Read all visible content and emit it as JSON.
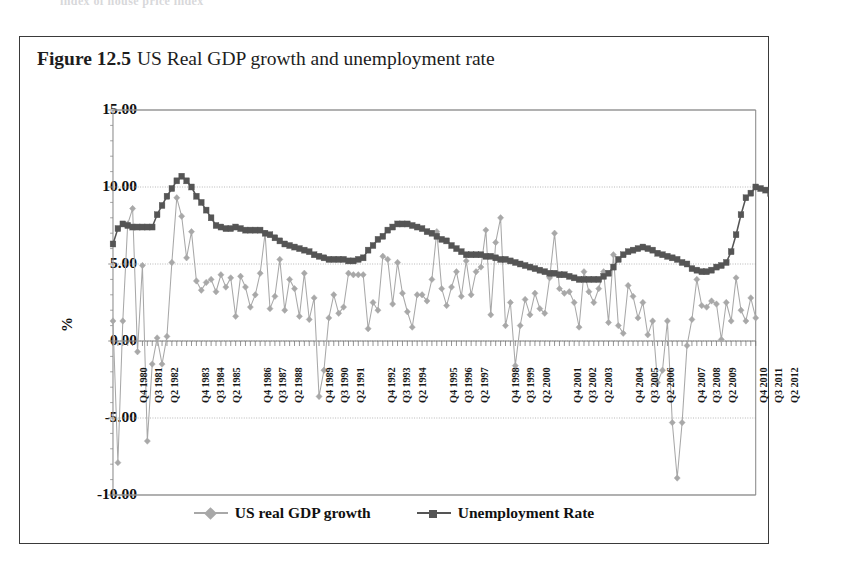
{
  "running_head": "index of house price index",
  "figure": {
    "number": "Figure 12.5",
    "caption": "US Real GDP growth and unemployment rate"
  },
  "colors": {
    "gdp_series": "#a8a8a8",
    "unemployment_series": "#555555",
    "axis": "#8a8a8a",
    "gridline": "#aaaaaa",
    "frame": "#3a3a3a",
    "text": "#111111"
  },
  "chart_data": {
    "type": "line",
    "title": "US Real GDP growth and unemployment rate",
    "xlabel": "",
    "ylabel": "%",
    "ylim": [
      -10,
      15
    ],
    "yticks": [
      15.0,
      10.0,
      5.0,
      0.0,
      -5.0,
      -10.0
    ],
    "ytick_labels": [
      "15.00",
      "10.00",
      "5.00",
      "0.00",
      "-5.00",
      "-10.00"
    ],
    "grid": true,
    "legend_position": "bottom",
    "xtick_labels": [
      "Q4 1980",
      "Q3 1981",
      "Q2 1982",
      "Q4 1983",
      "Q3 1984",
      "Q2 1985",
      "Q4 1986",
      "Q3 1987",
      "Q2 1988",
      "Q4 1989",
      "Q3 1990",
      "Q2 1991",
      "Q4 1992",
      "Q3 1993",
      "Q2 1994",
      "Q4 1995",
      "Q3 1996",
      "Q2 1997",
      "Q4 1998",
      "Q3 1999",
      "Q2 2000",
      "Q4 2001",
      "Q3 2002",
      "Q2 2003",
      "Q4 2004",
      "Q3 2005",
      "Q2 2006",
      "Q4 2007",
      "Q3 2008",
      "Q2 2009",
      "Q4 2010",
      "Q3 2011",
      "Q2 2012"
    ],
    "xtick_indices": [
      3,
      6,
      9,
      15,
      18,
      21,
      27,
      30,
      33,
      39,
      42,
      45,
      51,
      54,
      57,
      63,
      66,
      69,
      75,
      78,
      81,
      87,
      90,
      93,
      99,
      102,
      105,
      111,
      114,
      117,
      123,
      126,
      129
    ],
    "x_start_label": "Q1 1980",
    "x_end_label": "Q4 2012",
    "series": [
      {
        "name": "US real GDP growth",
        "marker": "diamond",
        "color": "#a8a8a8",
        "values": [
          1.3,
          -7.9,
          1.3,
          7.6,
          8.6,
          -0.7,
          4.9,
          -6.5,
          -1.5,
          0.2,
          -1.5,
          0.3,
          5.1,
          9.3,
          8.1,
          5.4,
          7.1,
          3.9,
          3.3,
          3.8,
          4.0,
          3.2,
          4.3,
          3.5,
          4.1,
          1.6,
          4.2,
          3.5,
          2.2,
          3.0,
          4.4,
          7.0,
          2.1,
          2.9,
          5.3,
          2.0,
          4.0,
          3.4,
          1.6,
          4.4,
          1.4,
          2.8,
          -3.6,
          -1.9,
          1.5,
          3.0,
          1.8,
          2.2,
          4.4,
          4.3,
          4.3,
          4.3,
          0.8,
          2.5,
          2.0,
          5.5,
          5.3,
          2.4,
          5.1,
          3.1,
          1.9,
          0.9,
          3.0,
          3.0,
          2.6,
          4.0,
          7.1,
          3.4,
          2.3,
          3.5,
          4.5,
          2.9,
          5.2,
          3.0,
          4.5,
          4.8,
          7.2,
          1.7,
          6.4,
          8.0,
          1.0,
          2.5,
          -1.6,
          1.0,
          2.7,
          1.7,
          3.1,
          2.1,
          1.8,
          4.1,
          7.0,
          3.4,
          3.1,
          3.2,
          2.5,
          0.9,
          4.5,
          3.2,
          2.5,
          3.4,
          4.5,
          1.2,
          5.6,
          1.0,
          0.5,
          3.6,
          2.9,
          1.5,
          2.5,
          0.4,
          1.3,
          -2.7,
          -1.9,
          1.3,
          -5.3,
          -8.9,
          -5.3,
          -0.3,
          1.4,
          4.0,
          2.3,
          2.2,
          2.6,
          2.4,
          0.1,
          2.5,
          1.3,
          4.1,
          2.0,
          1.3,
          2.8,
          1.5
        ]
      },
      {
        "name": "Unemployment Rate",
        "marker": "square",
        "color": "#555555",
        "values": [
          6.3,
          7.3,
          7.6,
          7.5,
          7.4,
          7.4,
          7.4,
          7.4,
          7.4,
          8.2,
          8.8,
          9.4,
          9.9,
          10.4,
          10.7,
          10.4,
          10.0,
          9.4,
          9.0,
          8.5,
          8.0,
          7.5,
          7.4,
          7.3,
          7.3,
          7.4,
          7.3,
          7.2,
          7.2,
          7.2,
          7.2,
          7.0,
          6.9,
          6.7,
          6.5,
          6.3,
          6.2,
          6.1,
          6.0,
          5.9,
          5.8,
          5.6,
          5.5,
          5.4,
          5.3,
          5.3,
          5.3,
          5.3,
          5.2,
          5.2,
          5.3,
          5.4,
          5.9,
          6.2,
          6.6,
          6.8,
          7.2,
          7.4,
          7.6,
          7.6,
          7.6,
          7.5,
          7.4,
          7.3,
          7.1,
          7.0,
          6.8,
          6.6,
          6.5,
          6.2,
          6.0,
          5.8,
          5.6,
          5.6,
          5.6,
          5.6,
          5.5,
          5.5,
          5.4,
          5.3,
          5.3,
          5.2,
          5.1,
          5.0,
          4.9,
          4.8,
          4.7,
          4.6,
          4.5,
          4.4,
          4.4,
          4.3,
          4.3,
          4.2,
          4.1,
          4.0,
          4.0,
          4.0,
          4.0,
          4.0,
          4.2,
          4.4,
          4.8,
          5.3,
          5.6,
          5.8,
          5.9,
          6.0,
          6.1,
          6.0,
          5.9,
          5.7,
          5.6,
          5.5,
          5.4,
          5.3,
          5.1,
          5.0,
          4.7,
          4.6,
          4.5,
          4.5,
          4.6,
          4.8,
          4.9,
          5.1,
          5.8,
          6.9,
          8.2,
          9.3,
          9.6,
          10.0,
          9.9,
          9.8,
          9.6,
          9.6,
          9.6,
          9.5,
          9.1,
          9.0,
          9.0,
          8.9,
          8.3,
          8.0
        ]
      }
    ]
  },
  "legend": [
    {
      "label": "US real GDP growth",
      "marker": "diamond",
      "color": "#a8a8a8"
    },
    {
      "label": "Unemployment Rate",
      "marker": "square",
      "color": "#555555"
    }
  ]
}
